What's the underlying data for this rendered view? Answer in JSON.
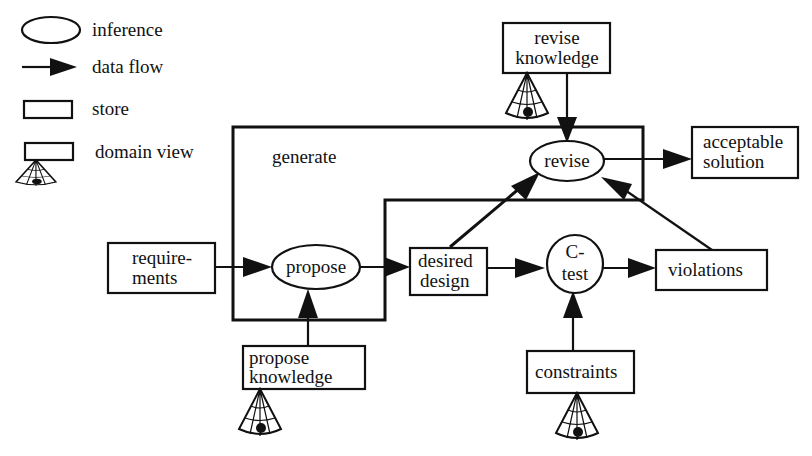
{
  "legend": {
    "items": [
      {
        "symbol": "ellipse",
        "label": "inference"
      },
      {
        "symbol": "arrow",
        "label": "data flow"
      },
      {
        "symbol": "rectangle",
        "label": "store"
      },
      {
        "symbol": "rectangle-with-cone",
        "label": "domain view"
      }
    ]
  },
  "frame": {
    "label": "generate"
  },
  "nodes": {
    "revise_knowledge": {
      "type": "store",
      "domain_view": true,
      "lines": [
        "revise",
        "knowledge"
      ]
    },
    "revise": {
      "type": "inference",
      "lines": [
        "revise"
      ]
    },
    "acceptable_solution": {
      "type": "store",
      "lines": [
        "acceptable",
        "solution"
      ]
    },
    "requirements": {
      "type": "store",
      "lines": [
        "require-",
        "ments"
      ]
    },
    "propose": {
      "type": "inference",
      "lines": [
        "propose"
      ]
    },
    "desired_design": {
      "type": "store",
      "lines": [
        "desired",
        "design"
      ]
    },
    "c_test": {
      "type": "inference",
      "lines": [
        "C-",
        "test"
      ]
    },
    "violations": {
      "type": "store",
      "lines": [
        "violations"
      ]
    },
    "propose_knowledge": {
      "type": "store",
      "domain_view": true,
      "lines": [
        "propose",
        "knowledge"
      ]
    },
    "constraints": {
      "type": "store",
      "domain_view": true,
      "lines": [
        "constraints"
      ]
    }
  },
  "edges": [
    {
      "from": "requirements",
      "to": "propose"
    },
    {
      "from": "propose_knowledge",
      "to": "propose"
    },
    {
      "from": "propose",
      "to": "desired_design"
    },
    {
      "from": "desired_design",
      "to": "c_test"
    },
    {
      "from": "constraints",
      "to": "c_test"
    },
    {
      "from": "c_test",
      "to": "violations"
    },
    {
      "from": "desired_design",
      "to": "revise"
    },
    {
      "from": "violations",
      "to": "revise"
    },
    {
      "from": "revise_knowledge",
      "to": "revise"
    },
    {
      "from": "revise",
      "to": "acceptable_solution"
    }
  ]
}
